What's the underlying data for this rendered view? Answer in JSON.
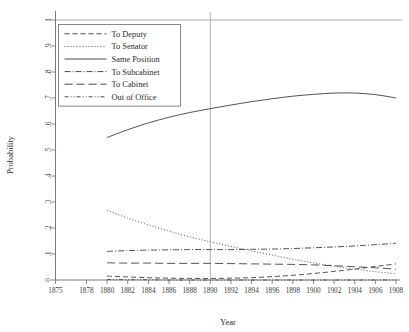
{
  "chart_data": {
    "type": "line",
    "title": "",
    "xlabel": "Year",
    "ylabel": "Probability",
    "xlim": [
      1875,
      1908
    ],
    "ylim": [
      0,
      1
    ],
    "grid": false,
    "legend_position": "top-left",
    "xticks": [
      1875,
      1878,
      1880,
      1882,
      1884,
      1886,
      1888,
      1890,
      1892,
      1894,
      1896,
      1898,
      1900,
      1902,
      1904,
      1906,
      1908
    ],
    "xtick_labels": [
      "1875",
      "1878",
      "1880",
      "1882",
      "1884",
      "1886",
      "1888",
      "1890",
      "1892",
      "1894",
      "1896",
      "1898",
      "1900",
      "1902",
      "1904",
      "1906",
      "1908"
    ],
    "yticks": [
      0,
      0.1,
      0.2,
      0.3,
      0.4,
      0.5,
      0.6,
      0.7,
      0.8,
      0.9,
      1
    ],
    "ytick_labels": [
      "0",
      ".1",
      ".2",
      ".3",
      ".4",
      ".5",
      ".6",
      ".7",
      ".8",
      ".9",
      "1"
    ],
    "annotations": [
      {
        "name": "reference-line-top",
        "type": "hline",
        "y": 1
      },
      {
        "name": "reference-line-1890",
        "type": "vline",
        "x": 1890
      }
    ],
    "x": [
      1880,
      1882,
      1884,
      1886,
      1888,
      1890,
      1892,
      1894,
      1896,
      1898,
      1900,
      1902,
      1904,
      1906,
      1908
    ],
    "series": [
      {
        "name": "To Deputy",
        "dash": "5,3",
        "values": [
          0.015,
          0.012,
          0.009,
          0.007,
          0.006,
          0.006,
          0.007,
          0.009,
          0.013,
          0.018,
          0.025,
          0.033,
          0.042,
          0.052,
          0.062
        ]
      },
      {
        "name": "To Senator",
        "dash": "1,2",
        "values": [
          0.268,
          0.238,
          0.212,
          0.188,
          0.166,
          0.147,
          0.129,
          0.112,
          0.096,
          0.08,
          0.066,
          0.053,
          0.042,
          0.032,
          0.024
        ]
      },
      {
        "name": "Same Position",
        "dash": "none",
        "values": [
          0.548,
          0.578,
          0.604,
          0.626,
          0.644,
          0.659,
          0.673,
          0.686,
          0.697,
          0.707,
          0.714,
          0.719,
          0.719,
          0.713,
          0.7
        ]
      },
      {
        "name": "To Subcabinet",
        "dash": "6,2,1,2",
        "values": [
          0.11,
          0.113,
          0.115,
          0.116,
          0.117,
          0.117,
          0.117,
          0.118,
          0.119,
          0.121,
          0.124,
          0.127,
          0.131,
          0.136,
          0.141
        ]
      },
      {
        "name": "To Cabinet",
        "dash": "8,4",
        "values": [
          0.066,
          0.065,
          0.065,
          0.064,
          0.064,
          0.064,
          0.063,
          0.062,
          0.061,
          0.06,
          0.058,
          0.055,
          0.051,
          0.047,
          0.042
        ]
      },
      {
        "name": "Out of Office",
        "dash": "4,2,1,2,1,2",
        "values": [
          0.002,
          0.001,
          0.001,
          0.0,
          0.0,
          0.0,
          0.0,
          0.0,
          0.0,
          0.0,
          0.0,
          0.0,
          0.0,
          0.0,
          0.0
        ]
      }
    ]
  },
  "colors": {
    "line": "#4a4a4a",
    "axis": "#6b6b6b",
    "reference": "#9a9a9a",
    "text": "#2b2b2b",
    "background": "#ffffff"
  }
}
